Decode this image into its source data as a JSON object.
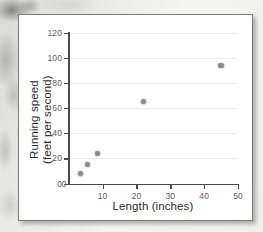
{
  "figure": {
    "accent_color": "#8c8c8c",
    "axis_color": "#4b4b4b",
    "grid_color": "#ececed"
  },
  "chart_data": {
    "type": "scatter",
    "title": "",
    "xlabel": "Length (inches)",
    "ylabel": "Running speed\n(feet per second)",
    "ylabel_line1": "Running speed",
    "ylabel_line2": "(feet per second)",
    "xlim": [
      0,
      50
    ],
    "ylim": [
      0,
      120
    ],
    "xticks": [
      0,
      10,
      20,
      30,
      40,
      50
    ],
    "xtick_labels": [
      "0",
      "10",
      "20",
      "30",
      "40",
      "50"
    ],
    "yticks": [
      0,
      20,
      40,
      60,
      80,
      100,
      120
    ],
    "ytick_labels": [
      "0",
      "20",
      "40",
      "60",
      "80",
      "100",
      "120"
    ],
    "grid": "horizontal",
    "legend": "none",
    "points": [
      {
        "x": 3.5,
        "y": 8
      },
      {
        "x": 5.5,
        "y": 15
      },
      {
        "x": 8.5,
        "y": 24
      },
      {
        "x": 22,
        "y": 65
      },
      {
        "x": 45,
        "y": 94
      }
    ],
    "series": [
      {
        "name": "Running speed vs length",
        "x": [
          3.5,
          5.5,
          8.5,
          22,
          45
        ],
        "values": [
          8,
          15,
          24,
          65,
          94
        ]
      }
    ]
  }
}
